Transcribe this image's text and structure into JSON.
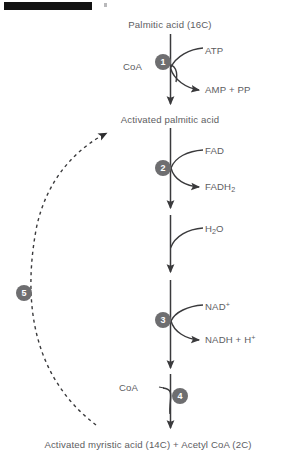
{
  "figure": {
    "type": "metabolic-pathway-diagram",
    "redaction_bar": true
  },
  "colors": {
    "text": "#5d5d5f",
    "line": "#3a3a3c",
    "badge_fill": "#6e6e70",
    "badge_text": "#ffffff",
    "redaction": "#121212",
    "background": "#ffffff"
  },
  "nodes": {
    "start": "Palmitic acid (16C)",
    "intermediate": "Activated palmitic acid",
    "end": "Activated myristic acid (14C) + Acetyl CoA (2C)"
  },
  "steps": [
    {
      "number": "1",
      "substrates": [
        "CoA",
        "ATP"
      ],
      "products": [
        "AMP + PP"
      ],
      "badge_side": "left"
    },
    {
      "number": "2",
      "substrates": [
        "FAD"
      ],
      "products": [
        "FADH",
        "2"
      ],
      "badge_side": "left"
    },
    {
      "number": "",
      "substrates": [
        "H",
        "2",
        "O"
      ],
      "products": [],
      "badge_side": "none"
    },
    {
      "number": "3",
      "substrates": [
        "NAD",
        "+"
      ],
      "products": [
        "NADH + H",
        "+"
      ],
      "badge_side": "left"
    },
    {
      "number": "4",
      "substrates": [
        "CoA"
      ],
      "products": [],
      "badge_side": "right"
    },
    {
      "number": "5",
      "substrates": [],
      "products": [],
      "badge_side": "far-left",
      "note": "recycle loop back to activated fatty acid"
    }
  ],
  "labels": {
    "atp": "ATP",
    "coa_step1": "CoA",
    "amp_pp": "AMP + PP",
    "fad": "FAD",
    "fadh2_base": "FADH",
    "fadh2_sub": "2",
    "water_h": "H",
    "water_sub": "2",
    "water_o": "O",
    "nad_base": "NAD",
    "nad_sup": "+",
    "nadh_base": "NADH + H",
    "nadh_sup": "+",
    "coa_step4": "CoA"
  },
  "badges": {
    "one": "1",
    "two": "2",
    "three": "3",
    "four": "4",
    "five": "5"
  }
}
